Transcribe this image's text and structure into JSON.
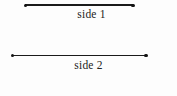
{
  "figure": {
    "background_color": "#fdfdfd",
    "line_color": "#1b1b1b",
    "text_color": "#232323",
    "segments": [
      {
        "label": "side 1",
        "endpoint_left_x": 25,
        "endpoint_right_x": 133,
        "y": 5,
        "length_px": 108
      },
      {
        "label": "side 2",
        "endpoint_left_x": 12,
        "endpoint_right_x": 146,
        "y": 55,
        "length_px": 134
      }
    ]
  }
}
